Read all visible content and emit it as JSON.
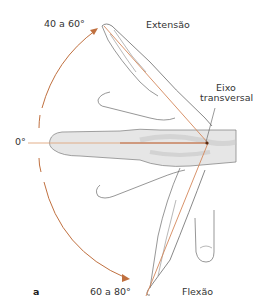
{
  "figure": {
    "panel_label": "a",
    "labels": {
      "extension_angle": "40 a 60°",
      "extension": "Extensão",
      "axis_line1": "Eixo",
      "axis_line2": "transversal",
      "neutral_angle": "0°",
      "flexion_angle": "60 a 80°",
      "flexion": "Flexão"
    },
    "colors": {
      "arc": "#c0703f",
      "axis_lines": "#d4875a",
      "neutral_line": "#e0a67e",
      "outline": "#555555",
      "bone_fill": "#d9d9d9",
      "pivot": "#5a2a10"
    },
    "angles": {
      "extension_range_deg": [
        40,
        60
      ],
      "flexion_range_deg": [
        60,
        80
      ],
      "neutral_deg": 0
    }
  }
}
